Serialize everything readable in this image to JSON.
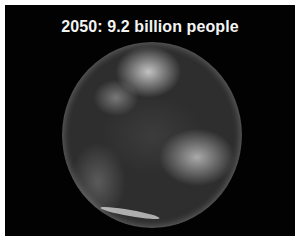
{
  "slide": {
    "title": "2050:  9.2 billion people",
    "image": "earth-globe-photo"
  }
}
